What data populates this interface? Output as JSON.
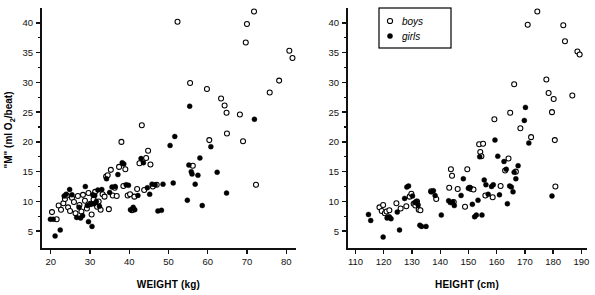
{
  "figure": {
    "background": "#ffffff",
    "foreground": "#000000"
  },
  "legend": {
    "position": "top-left-of-right-panel",
    "entries": [
      {
        "label": "boys",
        "marker": "open-circle"
      },
      {
        "label": "girls",
        "marker": "filled-circle"
      }
    ]
  },
  "chart_data": [
    {
      "type": "scatter",
      "panel": "left",
      "title": "",
      "xlabel": "WEIGHT (kg)",
      "ylabel": "\"M\" (ml O2/beat)",
      "ylabel_parts": {
        "pre": "\"M\" (ml O",
        "sub": "2",
        "post": "/beat)"
      },
      "xlim": [
        17.5,
        82.5
      ],
      "ylim": [
        2.0,
        42.5
      ],
      "xticks": [
        20,
        30,
        40,
        50,
        60,
        70,
        80
      ],
      "yticks": [
        5,
        10,
        15,
        20,
        25,
        30,
        35,
        40
      ],
      "yticks_minor": [
        7.5,
        12.5,
        17.5,
        22.5,
        27.5,
        32.5,
        37.5
      ],
      "grid": false,
      "series": [
        {
          "name": "boys",
          "marker": "open-circle",
          "points": [
            [
              20.3,
              8.2
            ],
            [
              21.5,
              7.0
            ],
            [
              22.0,
              9.3
            ],
            [
              22.6,
              8.6
            ],
            [
              23.2,
              9.7
            ],
            [
              23.6,
              10.4
            ],
            [
              24.1,
              11.0
            ],
            [
              24.4,
              9.0
            ],
            [
              24.9,
              8.4
            ],
            [
              25.4,
              10.6
            ],
            [
              25.9,
              9.9
            ],
            [
              26.3,
              8.0
            ],
            [
              26.9,
              10.9
            ],
            [
              27.3,
              9.4
            ],
            [
              27.8,
              8.3
            ],
            [
              28.2,
              11.1
            ],
            [
              28.7,
              10.1
            ],
            [
              29.2,
              8.8
            ],
            [
              29.6,
              11.4
            ],
            [
              30.1,
              9.6
            ],
            [
              30.4,
              7.8
            ],
            [
              30.9,
              10.3
            ],
            [
              31.3,
              11.6
            ],
            [
              31.8,
              9.1
            ],
            [
              32.2,
              10.0
            ],
            [
              32.7,
              8.6
            ],
            [
              33.2,
              11.2
            ],
            [
              33.7,
              10.8
            ],
            [
              34.1,
              14.2
            ],
            [
              34.5,
              14.4
            ],
            [
              34.8,
              8.7
            ],
            [
              35.3,
              15.3
            ],
            [
              35.8,
              11.0
            ],
            [
              36.3,
              12.3
            ],
            [
              36.8,
              10.9
            ],
            [
              37.4,
              15.8
            ],
            [
              38.0,
              20.0
            ],
            [
              38.5,
              12.6
            ],
            [
              39.0,
              15.4
            ],
            [
              39.6,
              11.0
            ],
            [
              40.2,
              11.2
            ],
            [
              40.7,
              8.5
            ],
            [
              41.3,
              10.8
            ],
            [
              42.0,
              12.1
            ],
            [
              42.6,
              16.4
            ],
            [
              43.2,
              22.8
            ],
            [
              43.8,
              11.9
            ],
            [
              44.3,
              17.3
            ],
            [
              44.8,
              18.5
            ],
            [
              45.4,
              16.2
            ],
            [
              46.0,
              12.5
            ],
            [
              47.0,
              12.8
            ],
            [
              52.3,
              40.2
            ],
            [
              55.5,
              29.9
            ],
            [
              56.2,
              16.0
            ],
            [
              59.8,
              28.9
            ],
            [
              60.4,
              20.3
            ],
            [
              63.4,
              27.3
            ],
            [
              64.3,
              26.1
            ],
            [
              64.8,
              24.9
            ],
            [
              64.9,
              21.4
            ],
            [
              68.2,
              24.6
            ],
            [
              69.0,
              20.1
            ],
            [
              69.7,
              36.7
            ],
            [
              70.0,
              39.8
            ],
            [
              71.8,
              41.9
            ],
            [
              72.3,
              12.8
            ],
            [
              75.8,
              28.3
            ],
            [
              78.2,
              30.3
            ],
            [
              80.8,
              35.3
            ],
            [
              81.6,
              34.1
            ]
          ]
        },
        {
          "name": "girls",
          "marker": "filled-circle",
          "points": [
            [
              19.9,
              7.0
            ],
            [
              20.6,
              7.0
            ],
            [
              21.1,
              4.2
            ],
            [
              22.4,
              5.2
            ],
            [
              23.4,
              10.9
            ],
            [
              23.9,
              11.2
            ],
            [
              24.8,
              12.0
            ],
            [
              25.4,
              11.1
            ],
            [
              26.6,
              7.3
            ],
            [
              27.2,
              9.0
            ],
            [
              27.6,
              7.2
            ],
            [
              28.1,
              7.6
            ],
            [
              28.8,
              12.5
            ],
            [
              29.3,
              9.3
            ],
            [
              29.6,
              6.6
            ],
            [
              30.2,
              9.5
            ],
            [
              30.5,
              5.8
            ],
            [
              30.7,
              11.1
            ],
            [
              31.0,
              9.6
            ],
            [
              31.2,
              11.0
            ],
            [
              31.6,
              10.0
            ],
            [
              32.0,
              11.9
            ],
            [
              32.4,
              9.2
            ],
            [
              33.0,
              12.0
            ],
            [
              34.2,
              13.8
            ],
            [
              35.0,
              11.5
            ],
            [
              35.6,
              12.4
            ],
            [
              36.4,
              12.5
            ],
            [
              37.1,
              14.5
            ],
            [
              38.2,
              16.5
            ],
            [
              38.6,
              16.3
            ],
            [
              39.2,
              12.8
            ],
            [
              39.8,
              12.7
            ],
            [
              40.3,
              8.6
            ],
            [
              41.0,
              9.0
            ],
            [
              41.4,
              8.6
            ],
            [
              42.2,
              11.0
            ],
            [
              43.0,
              17.2
            ],
            [
              43.6,
              16.5
            ],
            [
              44.6,
              12.3
            ],
            [
              45.2,
              11.2
            ],
            [
              45.8,
              12.9
            ],
            [
              46.6,
              12.8
            ],
            [
              47.3,
              8.4
            ],
            [
              48.2,
              8.5
            ],
            [
              48.6,
              12.9
            ],
            [
              50.4,
              19.4
            ],
            [
              51.2,
              13.1
            ],
            [
              51.6,
              20.9
            ],
            [
              54.8,
              10.2
            ],
            [
              55.2,
              16.1
            ],
            [
              55.4,
              26.0
            ],
            [
              55.8,
              15.0
            ],
            [
              56.0,
              14.6
            ],
            [
              56.8,
              12.9
            ],
            [
              57.5,
              14.4
            ],
            [
              58.0,
              17.3
            ],
            [
              58.6,
              9.3
            ],
            [
              60.8,
              19.2
            ],
            [
              62.4,
              14.9
            ],
            [
              64.8,
              11.4
            ],
            [
              71.9,
              23.8
            ]
          ]
        }
      ]
    },
    {
      "type": "scatter",
      "panel": "right",
      "title": "",
      "xlabel": "HEIGHT (cm)",
      "ylabel": "",
      "xlim": [
        107,
        192
      ],
      "ylim": [
        2.0,
        42.5
      ],
      "xticks": [
        110,
        120,
        130,
        140,
        150,
        160,
        170,
        180,
        190
      ],
      "yticks": [
        5,
        10,
        15,
        20,
        25,
        30,
        35,
        40
      ],
      "yticks_minor": [
        7.5,
        12.5,
        17.5,
        22.5,
        27.5,
        32.5,
        37.5
      ],
      "grid": false,
      "series": [
        {
          "name": "boys",
          "marker": "open-circle",
          "points": [
            [
              118.5,
              9.0
            ],
            [
              119.3,
              8.4
            ],
            [
              119.8,
              9.4
            ],
            [
              120.4,
              8.0
            ],
            [
              121.0,
              8.3
            ],
            [
              122.0,
              8.5
            ],
            [
              124.5,
              9.7
            ],
            [
              126.0,
              8.8
            ],
            [
              128.0,
              9.2
            ],
            [
              129.2,
              10.8
            ],
            [
              129.8,
              11.3
            ],
            [
              130.6,
              9.6
            ],
            [
              131.2,
              9.3
            ],
            [
              131.8,
              10.0
            ],
            [
              132.4,
              8.6
            ],
            [
              133.0,
              8.5
            ],
            [
              136.8,
              11.7
            ],
            [
              138.6,
              10.4
            ],
            [
              143.2,
              12.3
            ],
            [
              143.8,
              15.4
            ],
            [
              144.2,
              14.3
            ],
            [
              144.8,
              9.9
            ],
            [
              146.2,
              12.1
            ],
            [
              148.8,
              9.1
            ],
            [
              149.6,
              15.4
            ],
            [
              150.4,
              12.3
            ],
            [
              151.0,
              12.1
            ],
            [
              151.8,
              12.0
            ],
            [
              153.8,
              19.6
            ],
            [
              154.2,
              18.3
            ],
            [
              154.6,
              17.6
            ],
            [
              155.2,
              19.7
            ],
            [
              156.0,
              11.0
            ],
            [
              158.6,
              10.7
            ],
            [
              159.2,
              23.8
            ],
            [
              161.4,
              12.6
            ],
            [
              163.0,
              15.2
            ],
            [
              164.2,
              17.2
            ],
            [
              164.8,
              24.9
            ],
            [
              166.2,
              29.7
            ],
            [
              166.8,
              15.0
            ],
            [
              168.4,
              22.3
            ],
            [
              171.0,
              39.7
            ],
            [
              172.2,
              20.8
            ],
            [
              174.4,
              41.9
            ],
            [
              177.6,
              30.5
            ],
            [
              178.4,
              28.2
            ],
            [
              179.6,
              25.0
            ],
            [
              180.2,
              27.2
            ],
            [
              180.6,
              20.3
            ],
            [
              180.8,
              12.5
            ],
            [
              183.6,
              39.6
            ],
            [
              184.2,
              36.9
            ],
            [
              186.8,
              27.8
            ],
            [
              188.6,
              35.2
            ],
            [
              189.4,
              34.7
            ]
          ]
        },
        {
          "name": "girls",
          "marker": "filled-circle",
          "points": [
            [
              114.6,
              7.8
            ],
            [
              115.4,
              6.8
            ],
            [
              119.8,
              4.0
            ],
            [
              121.2,
              7.2
            ],
            [
              122.0,
              7.4
            ],
            [
              122.6,
              7.1
            ],
            [
              124.8,
              8.2
            ],
            [
              125.6,
              5.2
            ],
            [
              127.4,
              10.5
            ],
            [
              128.2,
              12.4
            ],
            [
              128.8,
              12.6
            ],
            [
              130.2,
              10.9
            ],
            [
              131.0,
              9.8
            ],
            [
              131.6,
              10.0
            ],
            [
              132.2,
              9.4
            ],
            [
              132.8,
              6.0
            ],
            [
              133.4,
              5.8
            ],
            [
              135.0,
              5.8
            ],
            [
              136.8,
              11.6
            ],
            [
              137.6,
              11.8
            ],
            [
              138.2,
              11.0
            ],
            [
              140.4,
              7.7
            ],
            [
              143.0,
              10.1
            ],
            [
              143.6,
              9.8
            ],
            [
              144.4,
              9.9
            ],
            [
              145.0,
              9.3
            ],
            [
              147.4,
              11.0
            ],
            [
              148.2,
              13.8
            ],
            [
              150.0,
              12.2
            ],
            [
              150.6,
              12.3
            ],
            [
              151.4,
              9.5
            ],
            [
              152.2,
              7.4
            ],
            [
              152.8,
              7.7
            ],
            [
              153.4,
              10.2
            ],
            [
              154.0,
              17.5
            ],
            [
              154.8,
              7.7
            ],
            [
              155.6,
              13.6
            ],
            [
              156.2,
              12.8
            ],
            [
              157.0,
              11.2
            ],
            [
              158.2,
              12.5
            ],
            [
              158.8,
              12.8
            ],
            [
              159.4,
              20.3
            ],
            [
              160.4,
              17.6
            ],
            [
              161.0,
              11.1
            ],
            [
              162.6,
              16.7
            ],
            [
              163.4,
              15.4
            ],
            [
              163.8,
              9.6
            ],
            [
              164.6,
              12.6
            ],
            [
              165.2,
              12.4
            ],
            [
              165.8,
              11.6
            ],
            [
              166.2,
              14.9
            ],
            [
              166.8,
              13.8
            ],
            [
              167.6,
              16.0
            ],
            [
              169.8,
              23.6
            ],
            [
              170.2,
              25.8
            ],
            [
              171.4,
              19.8
            ],
            [
              179.6,
              10.9
            ]
          ]
        }
      ]
    }
  ]
}
